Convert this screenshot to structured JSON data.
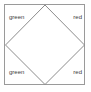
{
  "figure": {
    "background_color": "#ffffff",
    "square": {
      "stroke_color": "#9a9a9a",
      "stroke_width": 1,
      "fill_color": "#ffffff"
    },
    "diamond": {
      "stroke_color": "#8c8c8c",
      "stroke_width": 1,
      "fill_color": "none",
      "vertices_description": "midpoints of the square sides"
    },
    "labels": {
      "text_color": "#3c3c3c",
      "top_left": "green",
      "top_right": "red",
      "bottom_left": "green",
      "bottom_right": "red"
    }
  }
}
